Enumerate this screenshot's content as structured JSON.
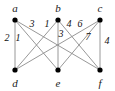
{
  "figure": {
    "type": "bipartite-graph",
    "background_color": "#ffffff",
    "edge_color": "#8c8c8c",
    "vertex_color": "#000000",
    "label_color": "#1a1a1a",
    "width": 115,
    "height": 91
  },
  "vertices": [
    {
      "id": "a",
      "label": "a",
      "x": 15,
      "y": 20,
      "label_x": 15,
      "label_y": 8,
      "part": "top"
    },
    {
      "id": "b",
      "label": "b",
      "x": 58,
      "y": 20,
      "label_x": 58,
      "label_y": 8,
      "part": "top"
    },
    {
      "id": "c",
      "label": "c",
      "x": 100,
      "y": 20,
      "label_x": 100,
      "label_y": 8,
      "part": "top"
    },
    {
      "id": "d",
      "label": "d",
      "x": 15,
      "y": 70,
      "label_x": 15,
      "label_y": 83,
      "part": "bottom"
    },
    {
      "id": "e",
      "label": "e",
      "x": 58,
      "y": 70,
      "label_x": 58,
      "label_y": 83,
      "part": "bottom"
    },
    {
      "id": "f",
      "label": "f",
      "x": 100,
      "y": 70,
      "label_x": 100,
      "label_y": 83,
      "part": "bottom"
    }
  ],
  "edges": [
    {
      "id": "a-d",
      "from": "a",
      "to": "d",
      "weight": "2",
      "label_x": 7,
      "label_y": 38
    },
    {
      "id": "a-e",
      "from": "a",
      "to": "e",
      "weight": "1",
      "label_x": 18,
      "label_y": 38
    },
    {
      "id": "a-f",
      "from": "a",
      "to": "f",
      "weight": "3",
      "label_x": 32,
      "label_y": 24
    },
    {
      "id": "b-d",
      "from": "b",
      "to": "d",
      "weight": "1",
      "label_x": 47,
      "label_y": 24
    },
    {
      "id": "b-e",
      "from": "b",
      "to": "e",
      "weight": "3",
      "label_x": 61,
      "label_y": 34
    },
    {
      "id": "b-f",
      "from": "b",
      "to": "f",
      "weight": "4",
      "label_x": 69,
      "label_y": 24
    },
    {
      "id": "c-d",
      "from": "c",
      "to": "d",
      "weight": "6",
      "label_x": 80,
      "label_y": 24
    },
    {
      "id": "c-e",
      "from": "c",
      "to": "e",
      "weight": "7",
      "label_x": 88,
      "label_y": 37
    },
    {
      "id": "c-f",
      "from": "c",
      "to": "f",
      "weight": "4",
      "label_x": 107,
      "label_y": 41
    }
  ],
  "chart_data": {
    "type": "diagram",
    "title": "",
    "graph_kind": "complete bipartite graph K3,3 with edge weights",
    "top_nodes": [
      "a",
      "b",
      "c"
    ],
    "bottom_nodes": [
      "d",
      "e",
      "f"
    ],
    "weight_matrix": {
      "rows": [
        "a",
        "b",
        "c"
      ],
      "columns": [
        "d",
        "e",
        "f"
      ],
      "values": [
        [
          2,
          1,
          3
        ],
        [
          1,
          3,
          4
        ],
        [
          6,
          7,
          4
        ]
      ]
    }
  }
}
